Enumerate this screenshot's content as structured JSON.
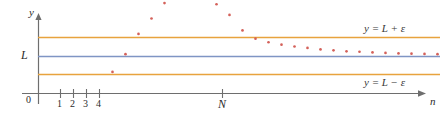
{
  "figure": {
    "caption": "Convergence of a sequence to limit L within epsilon band",
    "axis": {
      "y_label": "y",
      "x_label": "n",
      "origin_label": "0",
      "limit_label": "L",
      "threshold_label": "N",
      "tick_labels": [
        "1",
        "2",
        "3",
        "4"
      ]
    },
    "lines": {
      "upper_label": "y = L + ε",
      "center_label": "L",
      "lower_label": "y = L − ε"
    },
    "colors": {
      "axis": "#6e6e6e",
      "band": "#e8a33d",
      "limit_line": "#7f95c4",
      "points": "#d4615a",
      "text": "#2b2b2b"
    }
  },
  "chart_data": {
    "type": "scatter",
    "title": "",
    "xlabel": "n",
    "ylabel": "y",
    "grid": false,
    "legend": "none",
    "xlim": [
      0,
      30
    ],
    "ylim": [
      0,
      10
    ],
    "annotations": [
      {
        "text": "y = L + ε",
        "kind": "upper-band-line"
      },
      {
        "text": "y = L − ε",
        "kind": "lower-band-line"
      },
      {
        "text": "L",
        "kind": "limit-axis-label"
      },
      {
        "text": "N",
        "kind": "threshold-tick"
      },
      {
        "text": "0",
        "kind": "origin"
      }
    ],
    "reference_lines": [
      {
        "name": "y = L + ε",
        "y": 5.8,
        "color": "#e8a33d"
      },
      {
        "name": "y = L",
        "y": 5.0,
        "color": "#7f95c4"
      },
      {
        "name": "y = L − ε",
        "y": 4.2,
        "color": "#e8a33d"
      }
    ],
    "threshold_N": 14,
    "x": [
      1,
      2,
      3,
      4,
      5,
      6,
      7,
      8,
      9,
      10,
      11,
      12,
      13,
      14,
      15,
      16,
      17,
      18,
      19,
      20,
      21,
      22,
      23,
      24,
      25,
      26,
      27,
      28,
      29,
      30
    ],
    "y": [
      1.1,
      1.35,
      1.95,
      2.85,
      4.35,
      5.1,
      5.95,
      6.6,
      7.25,
      7.45,
      7.55,
      7.5,
      7.2,
      6.75,
      6.1,
      5.75,
      5.6,
      5.5,
      5.42,
      5.36,
      5.3,
      5.26,
      5.22,
      5.2,
      5.17,
      5.15,
      5.13,
      5.12,
      5.11,
      5.1
    ],
    "series": [
      {
        "name": "a_n",
        "marker": "dot",
        "color": "#d4615a",
        "points": [
          {
            "x": 1,
            "y": 1.1
          },
          {
            "x": 2,
            "y": 1.35
          },
          {
            "x": 3,
            "y": 1.95
          },
          {
            "x": 4,
            "y": 2.85
          },
          {
            "x": 5,
            "y": 4.35
          },
          {
            "x": 6,
            "y": 5.1
          },
          {
            "x": 7,
            "y": 5.95
          },
          {
            "x": 8,
            "y": 6.6
          },
          {
            "x": 9,
            "y": 7.25
          },
          {
            "x": 10,
            "y": 7.45
          },
          {
            "x": 11,
            "y": 7.55
          },
          {
            "x": 12,
            "y": 7.5
          },
          {
            "x": 13,
            "y": 7.2
          },
          {
            "x": 14,
            "y": 6.75
          },
          {
            "x": 15,
            "y": 6.1
          },
          {
            "x": 16,
            "y": 5.75
          },
          {
            "x": 17,
            "y": 5.6
          },
          {
            "x": 18,
            "y": 5.5
          },
          {
            "x": 19,
            "y": 5.42
          },
          {
            "x": 20,
            "y": 5.36
          },
          {
            "x": 21,
            "y": 5.3
          },
          {
            "x": 22,
            "y": 5.26
          },
          {
            "x": 23,
            "y": 5.22
          },
          {
            "x": 24,
            "y": 5.2
          },
          {
            "x": 25,
            "y": 5.17
          },
          {
            "x": 26,
            "y": 5.15
          },
          {
            "x": 27,
            "y": 5.13
          },
          {
            "x": 28,
            "y": 5.12
          },
          {
            "x": 29,
            "y": 5.11
          },
          {
            "x": 30,
            "y": 5.1
          }
        ]
      }
    ]
  }
}
